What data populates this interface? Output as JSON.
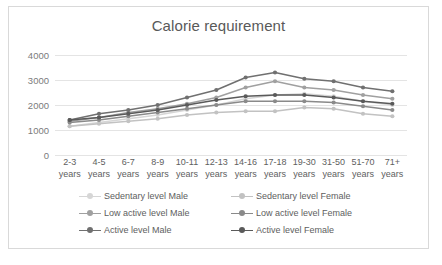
{
  "chart_data": {
    "type": "line",
    "title": "Calorie requirement",
    "xlabel": "",
    "ylabel": "",
    "ylim": [
      0,
      4000
    ],
    "yticks": [
      0,
      1000,
      2000,
      3000,
      4000
    ],
    "grid": true,
    "legend_position": "bottom",
    "categories": [
      "2-3 years",
      "4-5 years",
      "6-7 years",
      "8-9 years",
      "10-11 years",
      "12-13 years",
      "14-16 years",
      "17-18 years",
      "19-30 years",
      "31-50 years",
      "51-70 years",
      "71+ years"
    ],
    "category_lines": [
      [
        "2-3",
        "years"
      ],
      [
        "4-5",
        "years"
      ],
      [
        "6-7",
        "years"
      ],
      [
        "8-9",
        "years"
      ],
      [
        "10-11",
        "years"
      ],
      [
        "12-13",
        "years"
      ],
      [
        "14-16",
        "years"
      ],
      [
        "17-18",
        "years"
      ],
      [
        "19-30",
        "years"
      ],
      [
        "31-50",
        "years"
      ],
      [
        "51-70",
        "years"
      ],
      [
        "71+",
        "years"
      ]
    ],
    "series": [
      {
        "name": "Sedentary level Male",
        "color": "#d6d6d6",
        "values": [
          1150,
          1300,
          1450,
          1600,
          1800,
          2000,
          2250,
          2400,
          2450,
          2350,
          2150,
          2000
        ]
      },
      {
        "name": "Sedentary level Female",
        "color": "#c2c2c2",
        "values": [
          1150,
          1250,
          1350,
          1450,
          1600,
          1700,
          1750,
          1750,
          1900,
          1850,
          1650,
          1550
        ]
      },
      {
        "name": "Low active level Male",
        "color": "#a0a0a0",
        "values": [
          1350,
          1500,
          1700,
          1850,
          2050,
          2300,
          2700,
          2950,
          2700,
          2600,
          2400,
          2250
        ]
      },
      {
        "name": "Low active level Female",
        "color": "#8a8a8a",
        "values": [
          1300,
          1400,
          1550,
          1700,
          1850,
          2000,
          2150,
          2150,
          2150,
          2100,
          1950,
          1800
        ]
      },
      {
        "name": "Active level Male",
        "color": "#707070",
        "values": [
          1400,
          1650,
          1800,
          2000,
          2300,
          2600,
          3100,
          3300,
          3050,
          2950,
          2700,
          2550
        ]
      },
      {
        "name": "Active level Female",
        "color": "#5a5a5a",
        "values": [
          1400,
          1500,
          1650,
          1800,
          2000,
          2200,
          2350,
          2400,
          2400,
          2300,
          2150,
          2050
        ]
      }
    ]
  }
}
